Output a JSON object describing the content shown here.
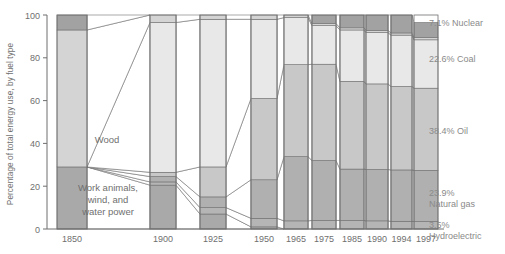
{
  "chart_data": {
    "type": "area",
    "title": "",
    "subtitle": "",
    "ylabel": "Percentage of total energy use, by fuel type",
    "xlabel": "",
    "ylim": [
      0,
      100
    ],
    "yticks": [
      0,
      20,
      40,
      60,
      80,
      100
    ],
    "grid": false,
    "legend_position": "right-labels",
    "categories": [
      "1850",
      "1900",
      "1925",
      "1950",
      "1965",
      "1975",
      "1985",
      "1990",
      "1994",
      "1997"
    ],
    "stack_order_bottom_to_top": [
      "Work animals, wind, and water power",
      "Hydroelectric",
      "Natural gas",
      "Oil",
      "Coal",
      "Wood",
      "Nuclear"
    ],
    "series": [
      {
        "name": "Work animals, wind, and water power",
        "color": "#a9a9a9",
        "values": [
          29.0,
          20.5,
          7.0,
          1.0,
          0.0,
          0.0,
          0.0,
          0.0,
          0.0,
          0.0
        ]
      },
      {
        "name": "Hydroelectric",
        "color": "#b5b5b5",
        "values": [
          0.0,
          1.5,
          3.0,
          4.0,
          3.8,
          4.0,
          4.0,
          3.8,
          3.6,
          3.5
        ]
      },
      {
        "name": "Natural gas",
        "color": "#b0b0b0",
        "values": [
          0.0,
          2.5,
          5.0,
          18.0,
          30.0,
          28.0,
          24.0,
          24.0,
          24.0,
          23.9
        ]
      },
      {
        "name": "Oil",
        "color": "#c8c8c8",
        "values": [
          0.0,
          2.0,
          14.0,
          38.0,
          43.0,
          45.0,
          41.0,
          40.0,
          39.0,
          38.4
        ]
      },
      {
        "name": "Coal",
        "color": "#e8e8e8",
        "values": [
          0.0,
          70.0,
          69.0,
          37.0,
          22.0,
          18.0,
          24.0,
          24.0,
          24.0,
          22.6
        ]
      },
      {
        "name": "Wood",
        "color": "#d4d4d4",
        "values": [
          64.0,
          3.5,
          2.0,
          2.0,
          1.2,
          1.0,
          1.0,
          1.0,
          1.0,
          1.0
        ]
      },
      {
        "name": "Nuclear",
        "color": "#a2a2a2",
        "values": [
          7.0,
          0.0,
          0.0,
          0.0,
          0.0,
          4.0,
          6.0,
          7.2,
          8.4,
          7.1
        ]
      }
    ],
    "right_labels": [
      {
        "text": "7.1% Nuclear",
        "value": 7.1,
        "fuel": "Nuclear"
      },
      {
        "text": "22.6% Coal",
        "value": 22.6,
        "fuel": "Coal"
      },
      {
        "text": "38.4% Oil",
        "value": 38.4,
        "fuel": "Oil"
      },
      {
        "text": "23.9%",
        "text2": "Natural gas",
        "value": 23.9,
        "fuel": "Natural gas"
      },
      {
        "text": "3.5%",
        "text2": "Hydroelectric",
        "value": 3.5,
        "fuel": "Hydroelectric"
      }
    ],
    "inner_annotations": [
      {
        "text": "Wood"
      },
      {
        "text_line1": "Work animals,",
        "text_line2": "wind, and",
        "text_line3": "water power"
      }
    ]
  },
  "axis": {
    "y_title": "Percentage of total energy use, by fuel type",
    "y_ticks": [
      "100",
      "80",
      "60",
      "40",
      "20",
      "0"
    ],
    "x_ticks": [
      "1850",
      "1900",
      "1925",
      "1950",
      "1965",
      "1975",
      "1985",
      "1990",
      "1994",
      "1997"
    ]
  },
  "side_labels": {
    "nuclear": "7.1% Nuclear",
    "coal": "22.6% Coal",
    "oil": "38.4% Oil",
    "gas_pct": "23.9%",
    "gas_name": "Natural gas",
    "hydro_pct": "3.5%",
    "hydro_name": "Hydroelectric"
  },
  "inner_labels": {
    "wood": "Wood",
    "work1": "Work animals,",
    "work2": "wind, and",
    "work3": "water power"
  },
  "colors": {
    "dark": "#a9a9a9",
    "mid": "#c8c8c8",
    "light": "#e8e8e8",
    "lighter": "#f2f2f2",
    "stroke": "#6f6f6f",
    "text": "#6f6f6f"
  }
}
